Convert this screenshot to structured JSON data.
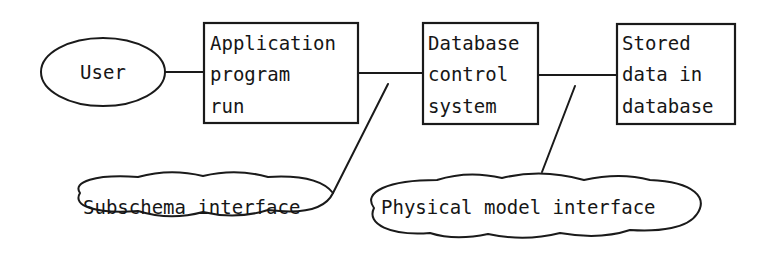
{
  "diagram": {
    "nodes": {
      "user": {
        "shape": "ellipse",
        "lines": [
          "User"
        ]
      },
      "app": {
        "shape": "box",
        "lines": [
          "Application",
          "program",
          "run"
        ]
      },
      "dbcs": {
        "shape": "box",
        "lines": [
          "Database",
          "control",
          "system"
        ]
      },
      "stored": {
        "shape": "box",
        "lines": [
          "Stored",
          "data in",
          "database"
        ]
      },
      "subschema": {
        "shape": "cloud",
        "lines": [
          "Subschema interface"
        ]
      },
      "physical": {
        "shape": "cloud",
        "lines": [
          "Physical model interface"
        ]
      }
    },
    "edges": [
      {
        "from": "user",
        "to": "app",
        "style": "line"
      },
      {
        "from": "app",
        "to": "dbcs",
        "style": "line"
      },
      {
        "from": "dbcs",
        "to": "stored",
        "style": "line"
      },
      {
        "from": "subschema",
        "to": "app-dbcs-link",
        "style": "callout"
      },
      {
        "from": "physical",
        "to": "dbcs-stored-link",
        "style": "callout"
      }
    ]
  }
}
